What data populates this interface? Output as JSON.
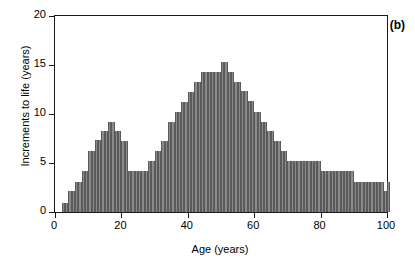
{
  "chart_data": {
    "type": "bar",
    "title": "",
    "subtitle": "",
    "panel_label": "(b)",
    "xlabel": "Age (years)",
    "ylabel": "Increments to life (years)",
    "xlim": [
      0,
      100
    ],
    "ylim": [
      0,
      20
    ],
    "xticks": [
      0,
      20,
      40,
      60,
      80,
      100
    ],
    "xtick_labels": [
      "0",
      "20",
      "40",
      "60",
      "80",
      "100"
    ],
    "yticks": [
      0,
      5,
      10,
      15,
      20
    ],
    "ytick_labels": [
      "0",
      "5",
      "10",
      "15",
      "20"
    ],
    "grid": false,
    "legend": null,
    "bar_color": "#8a8a8a",
    "bar_edge_color": "#5a5a5a",
    "axis_color": "#1a1a1a",
    "bin_width": 1,
    "categories": [
      0,
      1,
      2,
      3,
      4,
      5,
      6,
      7,
      8,
      9,
      10,
      11,
      12,
      13,
      14,
      15,
      16,
      17,
      18,
      19,
      20,
      21,
      22,
      23,
      24,
      25,
      26,
      27,
      28,
      29,
      30,
      31,
      32,
      33,
      34,
      35,
      36,
      37,
      38,
      39,
      40,
      41,
      42,
      43,
      44,
      45,
      46,
      47,
      48,
      49,
      50,
      51,
      52,
      53,
      54,
      55,
      56,
      57,
      58,
      59,
      60,
      61,
      62,
      63,
      64,
      65,
      66,
      67,
      68,
      69,
      70,
      71,
      72,
      73,
      74,
      75,
      76,
      77,
      78,
      79,
      80,
      81,
      82,
      83,
      84,
      85,
      86,
      87,
      88,
      89,
      90,
      91,
      92,
      93,
      94,
      95,
      96,
      97,
      98,
      99,
      100
    ],
    "values": [
      0,
      0,
      0.9,
      0.9,
      2.1,
      2.1,
      3.1,
      3.1,
      4.2,
      4.2,
      6.2,
      6.2,
      7.3,
      7.3,
      8.3,
      8.3,
      9.2,
      9.2,
      8.3,
      8.3,
      7.2,
      7.2,
      4.2,
      4.2,
      4.2,
      4.2,
      4.2,
      4.2,
      5.2,
      5.2,
      6.2,
      6.2,
      7.2,
      7.2,
      9.2,
      9.2,
      10.2,
      10.2,
      11.2,
      11.2,
      12.2,
      12.2,
      13.3,
      13.3,
      14.3,
      14.3,
      14.3,
      14.3,
      14.3,
      14.3,
      15.3,
      15.3,
      14.3,
      14.3,
      13.3,
      13.3,
      12.3,
      12.3,
      11.3,
      11.3,
      10.2,
      10.2,
      9.2,
      9.2,
      8.3,
      8.3,
      7.2,
      7.2,
      6.2,
      6.2,
      5.2,
      5.2,
      5.2,
      5.2,
      5.2,
      5.2,
      5.2,
      5.2,
      5.2,
      5.2,
      4.2,
      4.2,
      4.2,
      4.2,
      4.2,
      4.2,
      4.2,
      4.2,
      4.2,
      4.2,
      3.1,
      3.1,
      3.1,
      3.1,
      3.1,
      3.1,
      3.1,
      3.1,
      3.1,
      2.1,
      3.1
    ]
  }
}
